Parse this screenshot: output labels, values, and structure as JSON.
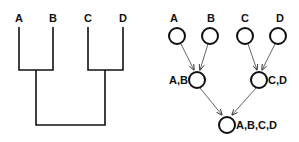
{
  "dendrogram": {
    "leaves": [
      {
        "label": "A",
        "x": 19
      },
      {
        "label": "B",
        "x": 53
      },
      {
        "label": "C",
        "x": 88
      },
      {
        "label": "D",
        "x": 123
      }
    ],
    "merges": [
      {
        "label": "A,B",
        "children": [
          "A",
          "B"
        ]
      },
      {
        "label": "C,D",
        "children": [
          "C",
          "D"
        ]
      },
      {
        "label": "A,B,C,D",
        "children": [
          "A,B",
          "C,D"
        ]
      }
    ]
  },
  "tree": {
    "nodes": {
      "a": {
        "label": "A"
      },
      "b": {
        "label": "B"
      },
      "c": {
        "label": "C"
      },
      "d": {
        "label": "D"
      },
      "ab": {
        "label": "A,B"
      },
      "cd": {
        "label": "C,D"
      },
      "abcd": {
        "label": "A,B,C,D"
      }
    },
    "edges": [
      [
        "A",
        "A,B"
      ],
      [
        "B",
        "A,B"
      ],
      [
        "C",
        "C,D"
      ],
      [
        "D",
        "C,D"
      ],
      [
        "A,B",
        "A,B,C,D"
      ],
      [
        "C,D",
        "A,B,C,D"
      ]
    ]
  }
}
